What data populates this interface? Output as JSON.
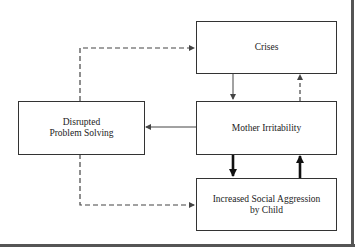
{
  "diagram": {
    "nodes": [
      {
        "id": "crises",
        "label_lines": [
          "Crises"
        ]
      },
      {
        "id": "mother_irritability",
        "label_lines": [
          "Mother Irritability"
        ]
      },
      {
        "id": "aggression",
        "label_lines": [
          "Increased Social Aggression",
          "by Child"
        ]
      },
      {
        "id": "disrupted",
        "label_lines": [
          "Disrupted",
          "Problem Solving"
        ]
      }
    ],
    "edges": [
      {
        "from": "crises",
        "to": "mother_irritability",
        "style": "solid-thin"
      },
      {
        "from": "mother_irritability",
        "to": "crises",
        "style": "dashed"
      },
      {
        "from": "mother_irritability",
        "to": "aggression",
        "style": "solid-thick"
      },
      {
        "from": "aggression",
        "to": "mother_irritability",
        "style": "solid-thick"
      },
      {
        "from": "mother_irritability",
        "to": "disrupted",
        "style": "solid-thin"
      },
      {
        "from": "disrupted",
        "to": "crises",
        "style": "dashed"
      },
      {
        "from": "disrupted",
        "to": "aggression",
        "style": "dashed"
      }
    ],
    "colors": {
      "line": "#444444",
      "box_border": "#333333",
      "frame": "#555555"
    }
  }
}
